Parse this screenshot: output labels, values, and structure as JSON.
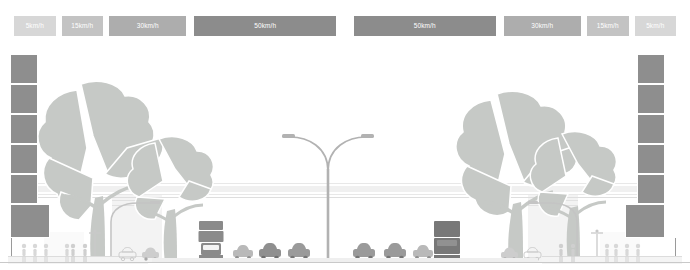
{
  "legend": {
    "name": "speed-legend-bar",
    "segments": [
      {
        "label": "5km/h",
        "color": "#d7d7d7",
        "width": 44,
        "gap_after": 6
      },
      {
        "label": "15km/h",
        "color": "#c3c3c3",
        "width": 44,
        "gap_after": 6
      },
      {
        "label": "30km/h",
        "color": "#adadad",
        "width": 82,
        "gap_after": 8
      },
      {
        "label": "50km/h",
        "color": "#8c8c8c",
        "width": 150,
        "gap_after": 18
      },
      {
        "label": "50km/h",
        "color": "#8c8c8c",
        "width": 150,
        "gap_after": 8
      },
      {
        "label": "30km/h",
        "color": "#adadad",
        "width": 82,
        "gap_after": 6
      },
      {
        "label": "15km/h",
        "color": "#c3c3c3",
        "width": 44,
        "gap_after": 6
      },
      {
        "label": "5km/h",
        "color": "#d7d7d7",
        "width": 44,
        "gap_after": 0
      }
    ]
  },
  "scene": {
    "name": "street-cross-section-illustration",
    "ground_color": "#c9c9c9",
    "road_color": "#efefef",
    "tower_color": "#8e8e8e",
    "tree_color": "#c6c9c6",
    "vehicle_dark": "#8a8a8a",
    "vehicle_light": "#d2d2d2"
  },
  "towers": [
    {
      "name": "tower-left",
      "x": 10,
      "y": 54,
      "seg_w": 28,
      "seg_h": 30,
      "segments": 6,
      "base_w": 40,
      "base_h": 34,
      "side": "left"
    },
    {
      "name": "tower-right",
      "x": 625,
      "y": 54,
      "seg_w": 28,
      "seg_h": 30,
      "segments": 6,
      "base_w": 40,
      "base_h": 34,
      "side": "right"
    }
  ],
  "trees": [
    {
      "name": "tree-left-large",
      "x": 35,
      "y": 78,
      "w": 130,
      "h": 185
    },
    {
      "name": "tree-left-small",
      "x": 125,
      "y": 135,
      "w": 95,
      "h": 128
    },
    {
      "name": "tree-right-large",
      "x": 455,
      "y": 90,
      "w": 125,
      "h": 173
    },
    {
      "name": "tree-right-small",
      "x": 528,
      "y": 130,
      "w": 95,
      "h": 133
    }
  ],
  "vehicles": [
    {
      "name": "truck-left",
      "type": "truck",
      "x": 197,
      "y": 221,
      "w": 26,
      "h": 40,
      "tone": "dark"
    },
    {
      "name": "car-left-1",
      "type": "car",
      "x": 232,
      "y": 243,
      "w": 22,
      "h": 18,
      "tone": "light"
    },
    {
      "name": "car-left-2",
      "type": "car",
      "x": 258,
      "y": 241,
      "w": 24,
      "h": 20,
      "tone": "mid"
    },
    {
      "name": "car-left-3",
      "type": "car",
      "x": 287,
      "y": 241,
      "w": 24,
      "h": 20,
      "tone": "mid"
    },
    {
      "name": "car-right-1",
      "type": "car",
      "x": 352,
      "y": 241,
      "w": 24,
      "h": 20,
      "tone": "mid"
    },
    {
      "name": "car-right-2",
      "type": "car",
      "x": 383,
      "y": 241,
      "w": 24,
      "h": 20,
      "tone": "mid"
    },
    {
      "name": "car-right-3",
      "type": "car",
      "x": 412,
      "y": 243,
      "w": 22,
      "h": 18,
      "tone": "light"
    },
    {
      "name": "truck-right",
      "type": "truck",
      "x": 432,
      "y": 220,
      "w": 28,
      "h": 41,
      "tone": "dark"
    },
    {
      "name": "car-service-left-1",
      "type": "car",
      "x": 118,
      "y": 246,
      "w": 18,
      "h": 15,
      "tone": "pale"
    },
    {
      "name": "car-service-left-2",
      "type": "car",
      "x": 141,
      "y": 246,
      "w": 18,
      "h": 15,
      "tone": "pale"
    },
    {
      "name": "car-service-right-1",
      "type": "car",
      "x": 500,
      "y": 246,
      "w": 18,
      "h": 15,
      "tone": "pale"
    },
    {
      "name": "car-service-right-2",
      "type": "car",
      "x": 523,
      "y": 246,
      "w": 18,
      "h": 15,
      "tone": "pale"
    }
  ],
  "pedestrian_groups": [
    {
      "name": "pedestrians-far-left",
      "x": 20,
      "y": 243,
      "count": 3
    },
    {
      "name": "pedestrians-left-walk",
      "x": 62,
      "y": 243,
      "count": 1
    },
    {
      "name": "pedestrians-left-plaza",
      "x": 68,
      "y": 243,
      "count": 2
    },
    {
      "name": "pedestrians-right-plaza",
      "x": 556,
      "y": 243,
      "count": 2
    },
    {
      "name": "pedestrians-right-walk",
      "x": 602,
      "y": 243,
      "count": 1
    },
    {
      "name": "pedestrians-far-right",
      "x": 612,
      "y": 243,
      "count": 3
    }
  ],
  "lamps": [
    {
      "name": "street-lamp-median-double",
      "x": 278,
      "y": 125,
      "w": 100,
      "h": 136,
      "type": "double-arm"
    },
    {
      "name": "street-lamp-left-curved",
      "x": 108,
      "y": 200,
      "w": 52,
      "h": 61,
      "type": "curved"
    },
    {
      "name": "street-lamp-right-curved",
      "x": 528,
      "y": 200,
      "w": 52,
      "h": 61,
      "type": "curved"
    },
    {
      "name": "pole-light-left-small",
      "x": 88,
      "y": 228,
      "w": 12,
      "h": 33,
      "type": "small"
    },
    {
      "name": "pole-light-right-small",
      "x": 590,
      "y": 228,
      "w": 12,
      "h": 33,
      "type": "small"
    }
  ]
}
